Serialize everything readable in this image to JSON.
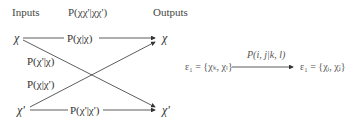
{
  "header": {
    "inputs_label": "Inputs",
    "joint_prob_label": "P(χχ'|χχ')",
    "outputs_label": "Outputs"
  },
  "nodes": {
    "input_top": "χ",
    "input_bottom": "χ'",
    "output_top": "χ",
    "output_bottom": "χ'"
  },
  "edges": {
    "top_straight": "P(χ|χ)",
    "cross_down": "P(χ'|χ)",
    "cross_up": "P(χ|χ')",
    "bottom_straight": "P(χ'|χ')"
  },
  "transition": {
    "left_state": "ε₁ = {χₖ, χₗ}",
    "arrow_label": "P(i, j|k, l)",
    "right_state": "ε₁ = {χᵢ, χⱼ}"
  },
  "colors": {
    "line": "#333333",
    "text": "#333333",
    "faint_text": "#666666"
  }
}
